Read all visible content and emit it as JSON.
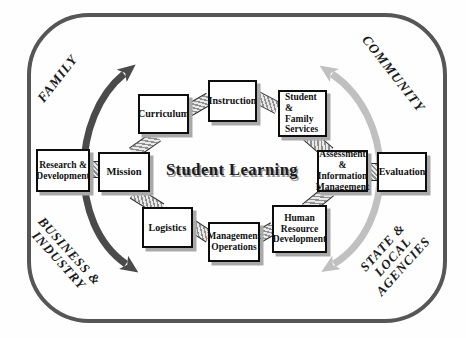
{
  "center": {
    "label": "Student Learning"
  },
  "corners": {
    "family": {
      "label": "FAMILY"
    },
    "community": {
      "label": "COMMUNITY"
    },
    "business_industry": {
      "label": "BUSINESS &\nINDUSTRY"
    },
    "state_local": {
      "label": "STATE & LOCAL\nAGENCIES"
    }
  },
  "boxes": [
    {
      "id": "research-development",
      "label": "Research &\nDevelopment"
    },
    {
      "id": "mission",
      "label": "Mission"
    },
    {
      "id": "curriculum",
      "label": "Curriculum"
    },
    {
      "id": "instruction",
      "label": "Instruction"
    },
    {
      "id": "student-family-services",
      "label": "Student &\nFamily\nServices"
    },
    {
      "id": "assessment-information-management",
      "label": "Assessment\n& Information\nManagement"
    },
    {
      "id": "evaluation",
      "label": "Evaluation"
    },
    {
      "id": "human-resource-development",
      "label": "Human\nResource\nDevelopment"
    },
    {
      "id": "management-operations",
      "label": "Management\nOperations"
    },
    {
      "id": "logistics",
      "label": "Logistics"
    }
  ],
  "colors": {
    "arrow_dark": "#4a4a4a",
    "arrow_light": "#c0c0c0",
    "frame": "#565656",
    "box_border": "#0d0d0d",
    "shadow": "#a9a9a9"
  }
}
